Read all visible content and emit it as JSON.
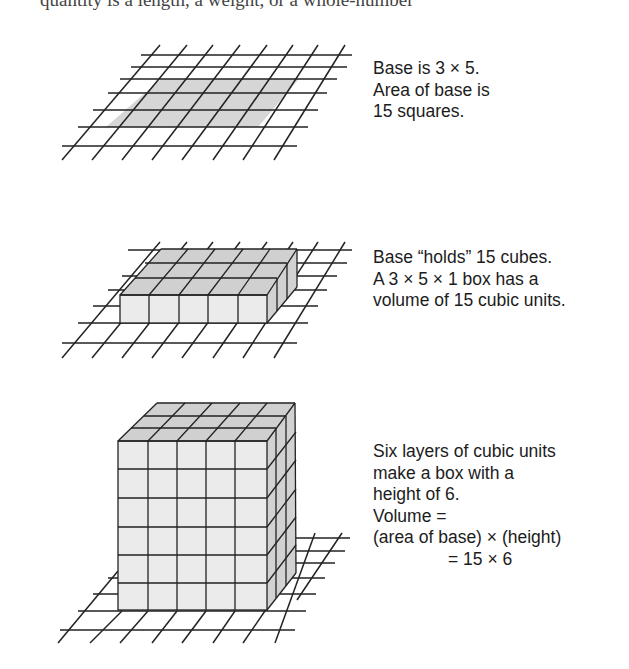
{
  "page": {
    "cutoff_text": "quantity is a length, a weight, or a whole-number"
  },
  "figures": [
    {
      "id": "base",
      "description": "3 x 5 shaded rectangle on a perspective square grid",
      "caption_lines": [
        "Base is 3 × 5.",
        "Area of base is",
        "15 squares."
      ]
    },
    {
      "id": "one-layer",
      "description": "3 x 5 x 1 layer of cubes on a perspective grid",
      "caption_lines": [
        "Base “holds” 15 cubes.",
        "A 3 × 5 × 1 box has a",
        "volume of 15 cubic units."
      ]
    },
    {
      "id": "six-layers",
      "description": "3 x 5 x 6 box of cubes on a perspective grid",
      "caption_lines": [
        "Six layers of cubic units",
        "make a box with a",
        "height of 6.",
        "Volume =",
        "(area of base) × (height)",
        "= 15 × 6"
      ]
    }
  ],
  "dimensions": {
    "base_rows": 3,
    "base_cols": 5,
    "base_area": 15,
    "layer_height": 1,
    "layer_volume": 15,
    "box_height": 6,
    "box_volume_expression": "15 × 6"
  },
  "colors": {
    "line": "#222222",
    "shade_base": "#d6d6d6",
    "cube_front": "#ebebeb",
    "cube_top": "#d0d0d0",
    "cube_side": "#d2d2d2",
    "text": "#1c1c1c"
  }
}
